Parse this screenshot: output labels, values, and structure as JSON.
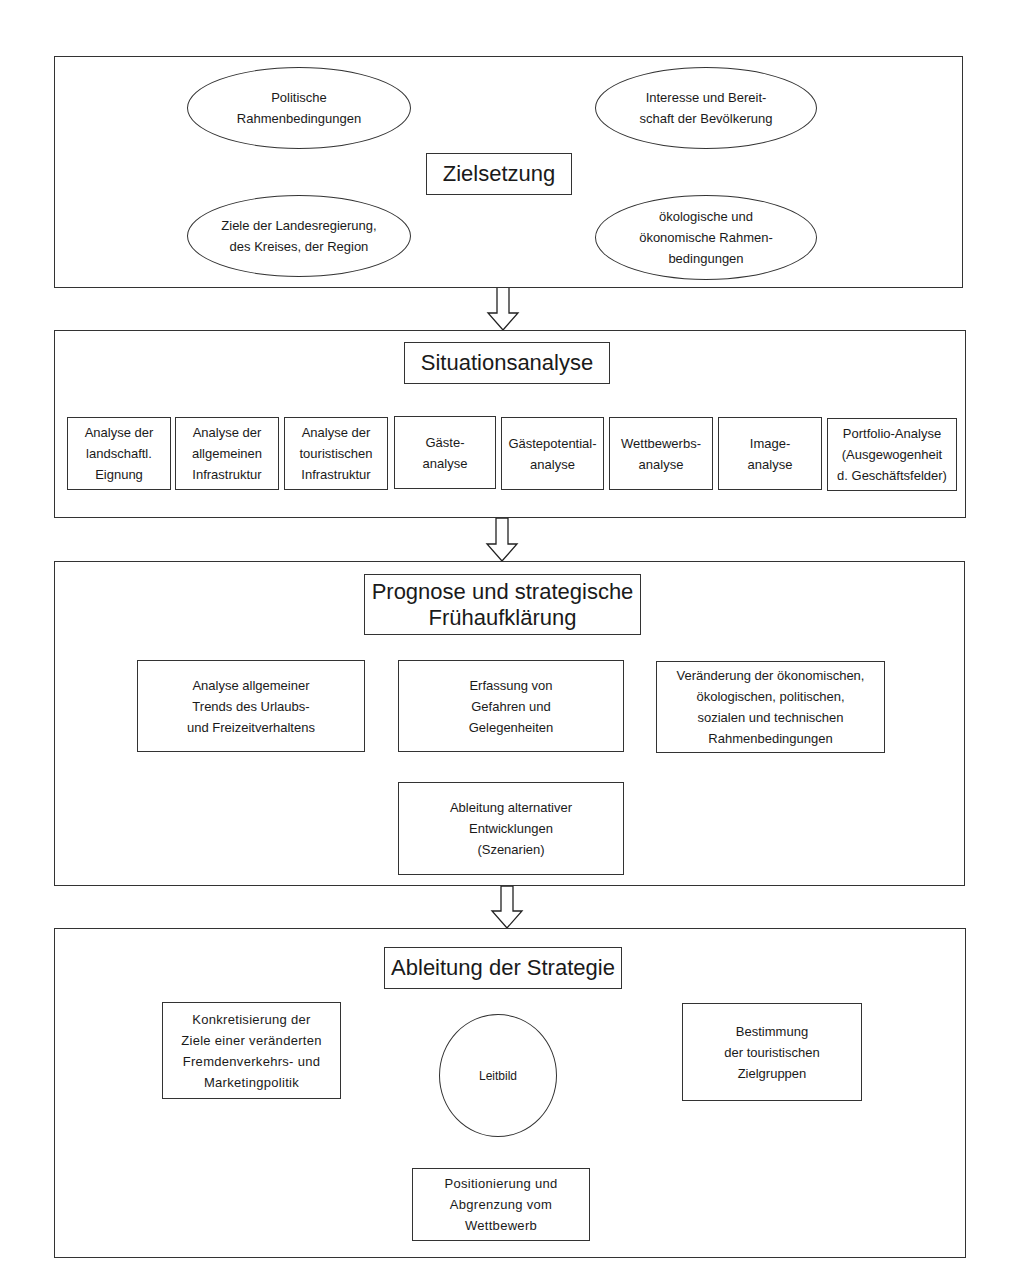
{
  "section1": {
    "title": "Zielsetzung",
    "ellipses": [
      {
        "label": "Politische\nRahmenbedingungen"
      },
      {
        "label": "Interesse und Bereit-\nschaft der Bevölkerung"
      },
      {
        "label": "Ziele der Landesregierung,\ndes Kreises, der Region"
      },
      {
        "label": "ökologische und\nökonomische Rahmen-\nbedingungen"
      }
    ]
  },
  "section2": {
    "title": "Situationsanalyse",
    "boxes": [
      {
        "label": "Analyse der\nlandschaftl.\nEignung"
      },
      {
        "label": "Analyse der\nallgemeinen\nInfrastruktur"
      },
      {
        "label": "Analyse der\ntouristischen\nInfrastruktur"
      },
      {
        "label": "Gäste-\nanalyse"
      },
      {
        "label": "Gästepotential-\nanalyse"
      },
      {
        "label": "Wettbewerbs-\nanalyse"
      },
      {
        "label": "Image-\nanalyse"
      },
      {
        "label": "Portfolio-Analyse\n(Ausgewogenheit\nd. Geschäftsfelder)"
      }
    ]
  },
  "section3": {
    "title": "Prognose und strategische\nFrühaufklärung",
    "boxes": [
      {
        "label": "Analyse allgemeiner\nTrends des Urlaubs-\nund Freizeitverhaltens"
      },
      {
        "label": "Erfassung von\nGefahren und\nGelegenheiten"
      },
      {
        "label": "Veränderung der ökonomischen,\nökologischen, politischen,\nsozialen und technischen\nRahmenbedingungen"
      }
    ],
    "result": "Ableitung alternativer\nEntwicklungen\n(Szenarien)"
  },
  "section4": {
    "title": "Ableitung der Strategie",
    "center": "Leitbild",
    "boxes": [
      {
        "label": "Konkretisierung der\nZiele einer veränderten\nFremdenverkehrs- und\nMarketingpolitik"
      },
      {
        "label": "Bestimmung\nder touristischen\nZielgruppen"
      },
      {
        "label": "Positionierung und\nAbgrenzung vom\nWettbewerb"
      }
    ]
  },
  "arrows": [
    {
      "icon": "down-arrow-icon"
    },
    {
      "icon": "down-arrow-icon"
    },
    {
      "icon": "down-arrow-icon"
    }
  ]
}
